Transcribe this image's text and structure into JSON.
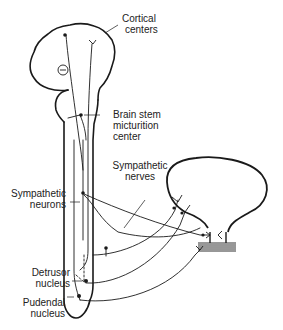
{
  "diagram": {
    "labels": {
      "cortical_centers": [
        "Cortical",
        "centers"
      ],
      "brain_stem": [
        "Brain stem",
        "micturition",
        "center"
      ],
      "sympathetic_nerves": [
        "Sympathetic",
        "nerves"
      ],
      "sympathetic_neurons": [
        "Sympathetic",
        "neurons"
      ],
      "detrusor_nucleus": [
        "Detrusor",
        "nucleus"
      ],
      "pudendal_nucleus": [
        "Pudendal",
        "nucleus"
      ]
    },
    "symbols": {
      "inhibition": "⊖"
    },
    "colors": {
      "line": "#1a1a1a",
      "background": "#ffffff",
      "text": "#222222"
    }
  }
}
